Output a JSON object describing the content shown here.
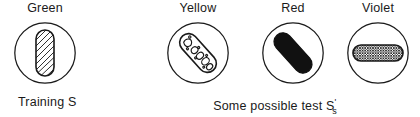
{
  "figure": {
    "background_color": "#ffffff",
    "stroke_color": "#1a1a1a",
    "fill_black": "#111111",
    "stimuli": [
      {
        "label": "Green",
        "icon": "vertical-hatched-pill-icon",
        "orientation": "vertical",
        "texture": "diagonal-hatch",
        "center_x": 45
      },
      {
        "label": "Yellow",
        "icon": "diagonal-mottled-pill-icon",
        "orientation": "diagonal-45",
        "texture": "irregular-blobs",
        "center_x": 198
      },
      {
        "label": "Red",
        "icon": "diagonal-solid-pill-icon",
        "orientation": "diagonal-45",
        "texture": "solid-black",
        "center_x": 293
      },
      {
        "label": "Violet",
        "icon": "horizontal-crosshatch-pill-icon",
        "orientation": "horizontal",
        "texture": "fine-crosshatch",
        "center_x": 378
      }
    ],
    "captions": {
      "training": "Training S",
      "test_prefix": "Some possible test S",
      "test_prime": "'",
      "test_subscript": "s"
    }
  }
}
